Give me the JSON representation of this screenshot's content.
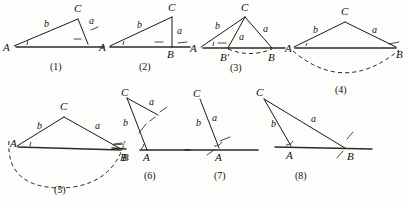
{
  "sheet": {
    "title": "Triangle construction cases (1)-(8)",
    "background_color": "#fdfdfb",
    "ink_color": "#1a1a1a",
    "width": 406,
    "height": 204
  },
  "figures": [
    {
      "id": "figure-1",
      "number": "(1)",
      "number_pos": {
        "x": 58,
        "y": 70
      },
      "vertices": [
        {
          "name": "A",
          "label": "A",
          "x": 12,
          "y": 47,
          "label_x": 3,
          "label_y": 51
        },
        {
          "name": "C",
          "label": "C",
          "x": 78,
          "y": 19,
          "label_x": 74,
          "label_y": 12
        }
      ],
      "foot": {
        "x": 88,
        "y": 44
      },
      "sides": [
        {
          "label": "b",
          "x": 44,
          "y": 27
        },
        {
          "label": "a",
          "x": 89,
          "y": 24
        }
      ],
      "base": {
        "x1": 16,
        "y1": 47,
        "x2": 104,
        "y2": 47
      },
      "has_angle_arc": true,
      "has_right_marks": true,
      "dash_ticks": [
        {
          "x1": 92,
          "y1": 30,
          "x2": 99,
          "y2": 26
        },
        {
          "x1": 74,
          "y1": 40,
          "x2": 81,
          "y2": 40
        }
      ]
    },
    {
      "id": "figure-2",
      "number": "(2)",
      "number_pos": {
        "x": 147,
        "y": 70
      },
      "vertices": [
        {
          "name": "A",
          "label": "A",
          "x": 108,
          "y": 47,
          "label_x": 99,
          "label_y": 51
        },
        {
          "name": "C",
          "label": "C",
          "x": 172,
          "y": 17,
          "label_x": 168,
          "label_y": 11
        },
        {
          "name": "B",
          "label": "B",
          "x": 172,
          "y": 47,
          "label_x": 168,
          "label_y": 58
        }
      ],
      "sides": [
        {
          "label": "b",
          "x": 138,
          "y": 27
        },
        {
          "label": "a",
          "x": 178,
          "y": 33
        }
      ],
      "base": {
        "x1": 112,
        "y1": 47,
        "x2": 190,
        "y2": 47
      },
      "has_angle_arc": true,
      "dash_ticks": [
        {
          "x1": 155,
          "y1": 42,
          "x2": 162,
          "y2": 42
        },
        {
          "x1": 178,
          "y1": 43,
          "x2": 186,
          "y2": 42
        }
      ]
    },
    {
      "id": "figure-3",
      "number": "(3)",
      "number_pos": {
        "x": 238,
        "y": 71
      },
      "vertices": [
        {
          "name": "A",
          "label": "A",
          "x": 199,
          "y": 48,
          "label_x": 190,
          "label_y": 52
        },
        {
          "name": "C",
          "label": "C",
          "x": 245,
          "y": 17,
          "label_x": 241,
          "label_y": 11
        },
        {
          "name": "Bprime",
          "label": "B'",
          "x": 228,
          "y": 48,
          "label_x": 221,
          "label_y": 60
        },
        {
          "name": "B",
          "label": "B",
          "x": 272,
          "y": 48,
          "label_x": 268,
          "label_y": 60
        }
      ],
      "sides": [
        {
          "label": "b",
          "x": 216,
          "y": 28
        },
        {
          "label": "a",
          "x": 240,
          "y": 38
        },
        {
          "label": "a",
          "x": 264,
          "y": 31
        }
      ],
      "base": {
        "x1": 203,
        "y1": 48,
        "x2": 285,
        "y2": 48
      },
      "has_angle_arc": true,
      "arc": {
        "cx": 250,
        "cy": 48,
        "rx": 22,
        "ry": 7
      },
      "dash_ticks": [
        {
          "x1": 218,
          "y1": 43,
          "x2": 225,
          "y2": 43
        }
      ]
    },
    {
      "id": "figure-4",
      "number": "(4)",
      "number_pos": {
        "x": 343,
        "y": 92
      },
      "vertices": [
        {
          "name": "A",
          "label": "A",
          "x": 295,
          "y": 48,
          "label_x": 286,
          "label_y": 52
        },
        {
          "name": "C",
          "label": "C",
          "x": 345,
          "y": 22,
          "label_x": 341,
          "label_y": 15
        },
        {
          "name": "B",
          "label": "B",
          "x": 396,
          "y": 48,
          "label_x": 396,
          "label_y": 58
        }
      ],
      "sides": [
        {
          "label": "b",
          "x": 315,
          "y": 32
        },
        {
          "label": "a",
          "x": 373,
          "y": 32
        }
      ],
      "base": {
        "x1": 295,
        "y1": 48,
        "x2": 396,
        "y2": 48
      },
      "has_angle_arc": true,
      "arc_path": "M 292 50 Q 345 95 399 49",
      "dash_ticks": [
        {
          "x1": 390,
          "y1": 44,
          "x2": 400,
          "y2": 43
        }
      ]
    },
    {
      "id": "figure-5",
      "number": "(5)",
      "number_pos": {
        "x": 62,
        "y": 192
      },
      "vertices": [
        {
          "name": "A",
          "label": "A",
          "x": 18,
          "y": 147,
          "label_x": 11,
          "label_y": 146
        },
        {
          "name": "C",
          "label": "C",
          "x": 64,
          "y": 117,
          "label_x": 60,
          "label_y": 110
        },
        {
          "name": "B",
          "label": "B",
          "x": 121,
          "y": 150,
          "label_x": 121,
          "label_y": 160
        }
      ],
      "sides": [
        {
          "label": "b",
          "x": 38,
          "y": 128
        },
        {
          "label": "a",
          "x": 96,
          "y": 128
        }
      ],
      "base": {
        "x1": 18,
        "y1": 147,
        "x2": 121,
        "y2": 150
      },
      "has_angle_arc": true,
      "arc_path": "M 9 142 Q 14 190 64 185 Q 114 180 124 142",
      "dash_ticks": [
        {
          "x1": 114,
          "y1": 145,
          "x2": 124,
          "y2": 144
        }
      ]
    },
    {
      "id": "figure-6",
      "number": "(6)",
      "number_pos": {
        "x": 152,
        "y": 178
      },
      "vertices": [
        {
          "name": "C",
          "label": "C",
          "x": 127,
          "y": 97,
          "label_x": 122,
          "label_y": 93
        },
        {
          "name": "B",
          "label": "B",
          "x": 126,
          "y": 149,
          "label_x": 124,
          "label_y": 160
        },
        {
          "name": "A",
          "label": "A",
          "x": 147,
          "y": 150,
          "label_x": 144,
          "label_y": 161
        }
      ],
      "foot": {
        "x": 158,
        "y": 115
      },
      "sides": [
        {
          "label": "b",
          "x": 125,
          "y": 125
        },
        {
          "label": "a",
          "x": 150,
          "y": 104
        }
      ],
      "base": {
        "x1": 140,
        "y1": 150,
        "x2": 190,
        "y2": 150
      },
      "has_angle_arc": true,
      "dash_ticks": [
        {
          "x1": 139,
          "y1": 131,
          "x2": 146,
          "y2": 124
        },
        {
          "x1": 160,
          "y1": 111,
          "x2": 166,
          "y2": 107
        },
        {
          "x1": 114,
          "y1": 144,
          "x2": 122,
          "y2": 144
        }
      ]
    },
    {
      "id": "figure-7",
      "number": "(7)",
      "number_pos": {
        "x": 222,
        "y": 178
      },
      "vertices": [
        {
          "name": "C",
          "label": "C",
          "x": 199,
          "y": 98,
          "label_x": 194,
          "label_y": 94
        },
        {
          "name": "A",
          "label": "A",
          "x": 219,
          "y": 148,
          "label_x": 216,
          "label_y": 160
        }
      ],
      "sides": [
        {
          "label": "b",
          "x": 199,
          "y": 124
        },
        {
          "label": "a",
          "x": 213,
          "y": 120
        }
      ],
      "base": {
        "x1": 185,
        "y1": 150,
        "x2": 258,
        "y2": 150
      },
      "has_angle_arc": true,
      "dash_ticks": [
        {
          "x1": 220,
          "y1": 141,
          "x2": 229,
          "y2": 138
        },
        {
          "x1": 208,
          "y1": 154,
          "x2": 214,
          "y2": 150
        }
      ]
    },
    {
      "id": "figure-8",
      "number": "(8)",
      "number_pos": {
        "x": 303,
        "y": 178
      },
      "vertices": [
        {
          "name": "C",
          "label": "C",
          "x": 264,
          "y": 98,
          "label_x": 257,
          "label_y": 95
        },
        {
          "name": "A",
          "label": "A",
          "x": 291,
          "y": 146,
          "label_x": 287,
          "label_y": 158
        },
        {
          "name": "B",
          "label": "B",
          "x": 345,
          "y": 148,
          "label_x": 347,
          "label_y": 159
        }
      ],
      "sides": [
        {
          "label": "b",
          "x": 273,
          "y": 126
        },
        {
          "label": "a",
          "x": 313,
          "y": 121
        }
      ],
      "base": {
        "x1": 275,
        "y1": 147,
        "x2": 372,
        "y2": 149
      },
      "has_angle_arc": true,
      "has_right_marks": true,
      "dash_ticks": [
        {
          "x1": 347,
          "y1": 139,
          "x2": 352,
          "y2": 133
        },
        {
          "x1": 338,
          "y1": 157,
          "x2": 343,
          "y2": 151
        }
      ]
    }
  ]
}
